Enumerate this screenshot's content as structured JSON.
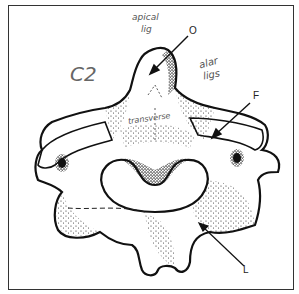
{
  "diagram": {
    "title_note": "C2",
    "annotations": {
      "apical": "apical",
      "apical_sub": "lig",
      "alar": "alar",
      "alar_sub": "ligs",
      "transverse": "transverse"
    },
    "labels": {
      "O": "O",
      "F": "F",
      "L": "L"
    },
    "colors": {
      "ink": "#1a1a1a",
      "pencil": "#666666",
      "border": "#333333"
    }
  }
}
